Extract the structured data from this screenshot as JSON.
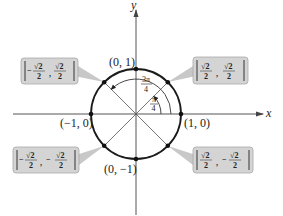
{
  "diagram": {
    "axes": {
      "x_label": "x",
      "y_label": "y"
    },
    "axis_points": [
      {
        "id": "top",
        "label": "(0, 1)"
      },
      {
        "id": "left",
        "label": "(−1, 0)"
      },
      {
        "id": "right",
        "label": "(1, 0)"
      },
      {
        "id": "bottom",
        "label": "(0, −1)"
      }
    ],
    "callouts": [
      {
        "id": "q1",
        "x_sign": "",
        "y_sign": "",
        "x_num": "√2",
        "x_den": "2",
        "y_num": "√2",
        "y_den": "2"
      },
      {
        "id": "q2",
        "x_sign": "−",
        "y_sign": "",
        "x_num": "√2",
        "x_den": "2",
        "y_num": "√2",
        "y_den": "2"
      },
      {
        "id": "q3",
        "x_sign": "−",
        "y_sign": "−",
        "x_num": "√2",
        "x_den": "2",
        "y_num": "√2",
        "y_den": "2"
      },
      {
        "id": "q4",
        "x_sign": "",
        "y_sign": "−",
        "x_num": "√2",
        "x_den": "2",
        "y_num": "√2",
        "y_den": "2"
      }
    ],
    "angles": [
      {
        "id": "pi4",
        "num": "π",
        "den": "4"
      },
      {
        "id": "3pi4",
        "num": "3π",
        "den": "4"
      }
    ],
    "colors": {
      "circle": "#1a1a1a",
      "axes": "#555555",
      "radial": "#6b6b6b",
      "callout_fill": "#d4d4d4",
      "callout_border": "#a8a8a8"
    }
  }
}
